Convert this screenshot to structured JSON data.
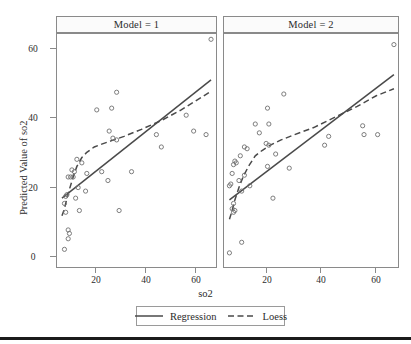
{
  "figure": {
    "ylabel": "Predicted Value of so2",
    "xlabel": "so2"
  },
  "panels": [
    {
      "strip_label": "Model = 1"
    },
    {
      "strip_label": "Model = 2"
    }
  ],
  "legend": {
    "items": [
      {
        "label": "Regression",
        "style": "solid"
      },
      {
        "label": "Loess",
        "style": "dashed"
      }
    ]
  },
  "axis_ticks": {
    "x": [
      "20",
      "40",
      "60"
    ],
    "y": [
      "0",
      "20",
      "40",
      "60"
    ]
  },
  "chart_data": {
    "type": "scatter",
    "title": "",
    "xlabel": "so2",
    "ylabel": "Predicted Value of so2",
    "xlim": [
      6,
      70
    ],
    "ylim": [
      -3,
      63
    ],
    "xticks": [
      20,
      40,
      60
    ],
    "yticks": [
      0,
      20,
      40,
      60
    ],
    "grid": false,
    "legend_position": "bottom",
    "panel_variable": "Model",
    "panels": [
      {
        "name": "Model = 1",
        "points": [
          {
            "x": 68.0,
            "y": 61.5
          },
          {
            "x": 30.0,
            "y": 46.5
          },
          {
            "x": 22.0,
            "y": 41.5
          },
          {
            "x": 28.0,
            "y": 42.0
          },
          {
            "x": 27.0,
            "y": 35.5
          },
          {
            "x": 28.5,
            "y": 33.5
          },
          {
            "x": 30.0,
            "y": 33.0
          },
          {
            "x": 58.0,
            "y": 40.0
          },
          {
            "x": 61.0,
            "y": 35.5
          },
          {
            "x": 66.0,
            "y": 34.5
          },
          {
            "x": 46.0,
            "y": 34.5
          },
          {
            "x": 48.0,
            "y": 31.0
          },
          {
            "x": 14.0,
            "y": 27.5
          },
          {
            "x": 16.0,
            "y": 26.5
          },
          {
            "x": 12.0,
            "y": 24.5
          },
          {
            "x": 13.0,
            "y": 24.0
          },
          {
            "x": 11.5,
            "y": 22.5
          },
          {
            "x": 12.5,
            "y": 22.5
          },
          {
            "x": 10.5,
            "y": 22.5
          },
          {
            "x": 18.0,
            "y": 23.5
          },
          {
            "x": 24.0,
            "y": 24.0
          },
          {
            "x": 36.0,
            "y": 24.0
          },
          {
            "x": 26.5,
            "y": 21.5
          },
          {
            "x": 17.5,
            "y": 18.5
          },
          {
            "x": 14.5,
            "y": 19.5
          },
          {
            "x": 10.0,
            "y": 17.5
          },
          {
            "x": 9.5,
            "y": 17.0
          },
          {
            "x": 13.5,
            "y": 16.5
          },
          {
            "x": 9.0,
            "y": 15.0
          },
          {
            "x": 9.5,
            "y": 12.5
          },
          {
            "x": 15.0,
            "y": 13.0
          },
          {
            "x": 31.0,
            "y": 13.0
          },
          {
            "x": 10.5,
            "y": 7.5
          },
          {
            "x": 11.0,
            "y": 6.5
          },
          {
            "x": 10.5,
            "y": 5.0
          },
          {
            "x": 9.0,
            "y": 2.0
          }
        ],
        "regression_line": {
          "x": [
            8.0,
            68.0
          ],
          "y": [
            16.5,
            50.0
          ]
        },
        "loess_curve": {
          "x": [
            8.0,
            9.0,
            10.0,
            11.0,
            12.5,
            14.0,
            16.0,
            18.0,
            21.0,
            24.0,
            28.0,
            33.0,
            40.0,
            48.0,
            56.0,
            64.0,
            68.0
          ],
          "y": [
            11.5,
            13.5,
            16.5,
            19.0,
            22.5,
            25.5,
            28.0,
            29.5,
            31.0,
            31.8,
            32.8,
            34.0,
            36.0,
            38.5,
            41.5,
            45.0,
            46.8
          ]
        }
      },
      {
        "name": "Model = 2",
        "points": [
          {
            "x": 68.5,
            "y": 60.0
          },
          {
            "x": 28.0,
            "y": 46.0
          },
          {
            "x": 22.0,
            "y": 42.0
          },
          {
            "x": 17.5,
            "y": 37.5
          },
          {
            "x": 22.5,
            "y": 37.5
          },
          {
            "x": 19.0,
            "y": 35.0
          },
          {
            "x": 57.0,
            "y": 37.0
          },
          {
            "x": 57.5,
            "y": 34.5
          },
          {
            "x": 62.5,
            "y": 34.5
          },
          {
            "x": 44.5,
            "y": 34.0
          },
          {
            "x": 43.0,
            "y": 31.5
          },
          {
            "x": 21.5,
            "y": 32.0
          },
          {
            "x": 22.5,
            "y": 31.5
          },
          {
            "x": 13.5,
            "y": 31.0
          },
          {
            "x": 14.5,
            "y": 30.5
          },
          {
            "x": 25.0,
            "y": 29.0
          },
          {
            "x": 12.0,
            "y": 28.5
          },
          {
            "x": 10.0,
            "y": 27.0
          },
          {
            "x": 10.5,
            "y": 26.5
          },
          {
            "x": 9.5,
            "y": 26.0
          },
          {
            "x": 22.0,
            "y": 25.5
          },
          {
            "x": 30.0,
            "y": 25.0
          },
          {
            "x": 9.0,
            "y": 23.5
          },
          {
            "x": 13.5,
            "y": 23.0
          },
          {
            "x": 11.5,
            "y": 21.5
          },
          {
            "x": 8.5,
            "y": 20.5
          },
          {
            "x": 8.0,
            "y": 20.0
          },
          {
            "x": 15.5,
            "y": 20.0
          },
          {
            "x": 12.5,
            "y": 18.5
          },
          {
            "x": 24.0,
            "y": 16.5
          },
          {
            "x": 9.5,
            "y": 15.0
          },
          {
            "x": 9.0,
            "y": 13.5
          },
          {
            "x": 10.0,
            "y": 13.0
          },
          {
            "x": 9.5,
            "y": 12.5
          },
          {
            "x": 12.5,
            "y": 4.0
          },
          {
            "x": 8.0,
            "y": 1.0
          }
        ],
        "regression_line": {
          "x": [
            8.0,
            68.5
          ],
          "y": [
            16.0,
            51.5
          ]
        },
        "loess_curve": {
          "x": [
            8.0,
            9.0,
            10.0,
            11.5,
            13.0,
            15.0,
            17.5,
            20.0,
            23.0,
            27.0,
            32.0,
            39.0,
            47.0,
            55.0,
            62.0,
            68.5
          ],
          "y": [
            10.5,
            13.0,
            16.0,
            19.5,
            22.5,
            25.5,
            28.5,
            30.0,
            31.5,
            33.0,
            34.5,
            36.5,
            39.5,
            42.5,
            45.5,
            47.5
          ]
        }
      }
    ]
  }
}
